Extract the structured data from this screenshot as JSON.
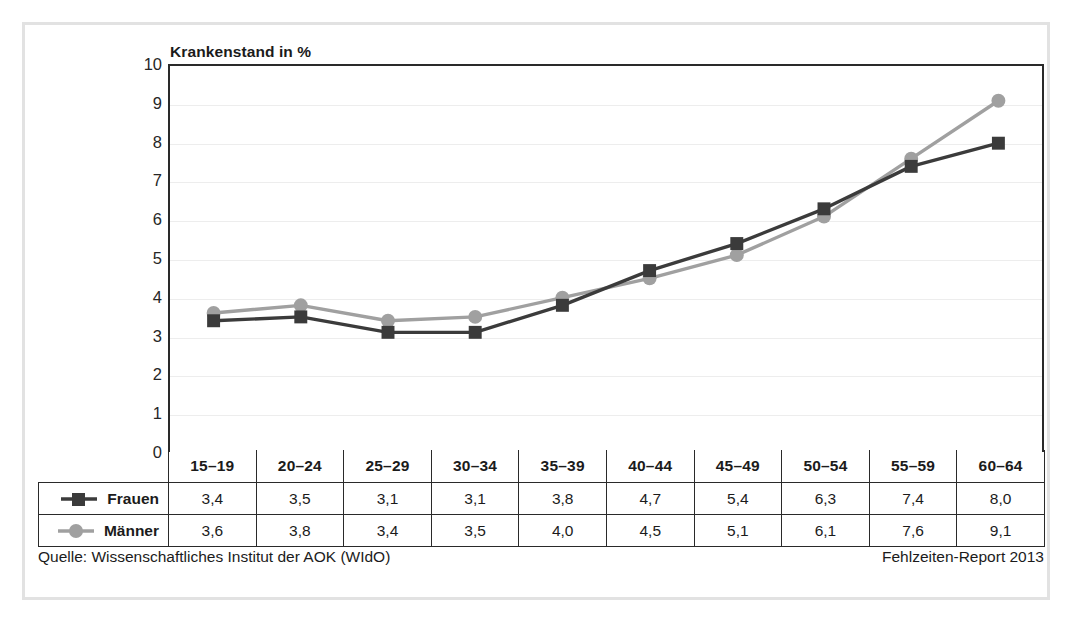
{
  "chart_data": {
    "type": "line",
    "title": "Krankenstand in %",
    "xlabel": "",
    "ylabel": "Krankenstand in %",
    "ylim": [
      0,
      10
    ],
    "yticks": [
      0,
      1,
      2,
      3,
      4,
      5,
      6,
      7,
      8,
      9,
      10
    ],
    "grid": true,
    "legend_position": "table-left",
    "categories": [
      "15–19",
      "20–24",
      "25–29",
      "30–34",
      "35–39",
      "40–44",
      "45–49",
      "50–54",
      "55–59",
      "60–64"
    ],
    "series": [
      {
        "name": "Frauen",
        "marker": "square",
        "color": "#3b3b3b",
        "values": [
          3.4,
          3.5,
          3.1,
          3.1,
          3.8,
          4.7,
          5.4,
          6.3,
          7.4,
          8.0
        ],
        "labels": [
          "3,4",
          "3,5",
          "3,1",
          "3,1",
          "3,8",
          "4,7",
          "5,4",
          "6,3",
          "7,4",
          "8,0"
        ]
      },
      {
        "name": "Männer",
        "marker": "circle",
        "color": "#a0a0a0",
        "values": [
          3.6,
          3.8,
          3.4,
          3.5,
          4.0,
          4.5,
          5.1,
          6.1,
          7.6,
          9.1
        ],
        "labels": [
          "3,6",
          "3,8",
          "3,4",
          "3,5",
          "4,0",
          "4,5",
          "5,1",
          "6,1",
          "7,6",
          "9,1"
        ]
      }
    ]
  },
  "footer": {
    "source": "Quelle: Wissenschaftliches Institut der AOK (WIdO)",
    "report": "Fehlzeiten-Report 2013"
  },
  "colors": {
    "frauen": "#3b3b3b",
    "maenner": "#a0a0a0",
    "axis": "#2a2a2a",
    "grid": "#ededed",
    "frame": "#e2e2e2"
  }
}
